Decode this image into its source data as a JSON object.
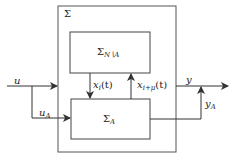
{
  "diagram": {
    "outer_block": {
      "label": "Σ"
    },
    "upper_block": {
      "symbol": "Σ",
      "subscript": "N∖A"
    },
    "lower_block": {
      "symbol": "Σ",
      "subscript": "A"
    },
    "signals": {
      "input": {
        "base": "u",
        "sub": ""
      },
      "input_to_A": {
        "base": "u",
        "sub": "A"
      },
      "state_down": {
        "base": "x",
        "sub": "i",
        "arg": "(t)"
      },
      "state_up": {
        "base": "x",
        "sub": "i+μ",
        "arg": "(t)"
      },
      "output": {
        "base": "y",
        "sub": ""
      },
      "output_A": {
        "base": "y",
        "sub": "A"
      }
    },
    "colors": {
      "stroke": "#333333",
      "background": "#ffffff"
    }
  }
}
